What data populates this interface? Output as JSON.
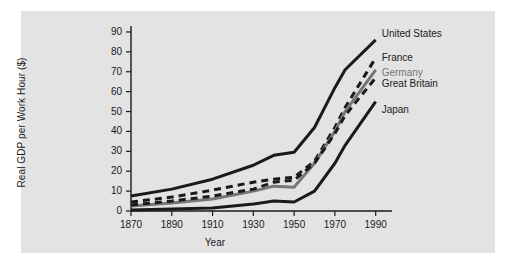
{
  "chart_data": {
    "type": "line",
    "title": "",
    "xlabel": "Year",
    "ylabel": "Real GDP per Work Hour ($)",
    "xlim": [
      1870,
      1998
    ],
    "ylim": [
      0,
      93
    ],
    "xticks": [
      1870,
      1890,
      1910,
      1930,
      1950,
      1970,
      1990
    ],
    "yticks": [
      0,
      10,
      20,
      30,
      40,
      50,
      60,
      70,
      80,
      90
    ],
    "grid": false,
    "legend_position": "right-inline-end-of-line",
    "x": [
      1870,
      1890,
      1910,
      1930,
      1940,
      1950,
      1960,
      1970,
      1975,
      1990
    ],
    "series": [
      {
        "name": "United States",
        "color": "#1a1a1a",
        "style": "solid",
        "values": [
          7.5,
          11,
          16,
          23,
          28,
          29.5,
          42,
          62,
          71,
          86
        ]
      },
      {
        "name": "France",
        "color": "#1a1a1a",
        "style": "dashed",
        "values": [
          4.5,
          7,
          10.5,
          14.5,
          16,
          17,
          25,
          42,
          52,
          77
        ]
      },
      {
        "name": "Germany",
        "color": "#767676",
        "style": "solid",
        "values": [
          2.5,
          4,
          6,
          10,
          12.5,
          12,
          24,
          40,
          50,
          71
        ]
      },
      {
        "name": "Great Britain",
        "color": "#1a1a1a",
        "style": "dashed",
        "values": [
          3,
          5,
          7.5,
          11,
          14.5,
          15.5,
          24,
          39,
          48,
          67
        ]
      },
      {
        "name": "Japan",
        "color": "#1a1a1a",
        "style": "solid",
        "values": [
          0.5,
          1,
          1.5,
          3.5,
          5,
          4.5,
          10,
          24,
          33,
          55
        ]
      }
    ]
  },
  "labels": {
    "united_states": "United States",
    "france": "France",
    "germany": "Germany",
    "great_britain": "Great Britain",
    "japan": "Japan"
  }
}
